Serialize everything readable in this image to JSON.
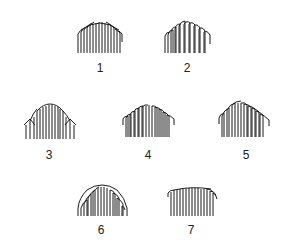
{
  "figures": [
    {
      "id": 1,
      "label": "1",
      "shape": "dome-fringe-wide",
      "x": 77,
      "y": 20,
      "w": 46,
      "h": 34,
      "label_x": 90,
      "label_y": 62
    },
    {
      "id": 2,
      "label": "2",
      "shape": "dome-fringe-peaked",
      "x": 164,
      "y": 20,
      "w": 47,
      "h": 34,
      "label_x": 177,
      "label_y": 62
    },
    {
      "id": 3,
      "label": "3",
      "shape": "dome-fringe-shouldered",
      "x": 23,
      "y": 103,
      "w": 54,
      "h": 37,
      "label_x": 39,
      "label_y": 149
    },
    {
      "id": 4,
      "label": "4",
      "shape": "dome-fringe-low",
      "x": 122,
      "y": 103,
      "w": 53,
      "h": 35,
      "label_x": 138,
      "label_y": 149
    },
    {
      "id": 5,
      "label": "5",
      "shape": "dome-fringe-asymmetric",
      "x": 218,
      "y": 100,
      "w": 52,
      "h": 38,
      "label_x": 236,
      "label_y": 149
    },
    {
      "id": 6,
      "label": "6",
      "shape": "dome-fringe-rounded",
      "x": 77,
      "y": 184,
      "w": 51,
      "h": 33,
      "label_x": 91,
      "label_y": 224
    },
    {
      "id": 7,
      "label": "7",
      "shape": "fringe-flat-top",
      "x": 167,
      "y": 187,
      "w": 51,
      "h": 30,
      "label_x": 181,
      "label_y": 224
    }
  ],
  "stroke_color": "#1a1a1a"
}
